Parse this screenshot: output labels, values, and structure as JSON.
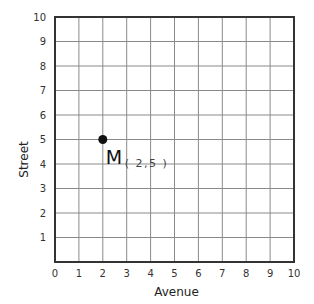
{
  "chart_data": {
    "type": "scatter",
    "title": "",
    "xlabel": "Avenue",
    "ylabel": "Street",
    "xlim": [
      0,
      10
    ],
    "ylim": [
      0,
      10
    ],
    "grid": true,
    "x_ticks": [
      "0",
      "1",
      "2",
      "3",
      "4",
      "5",
      "6",
      "7",
      "8",
      "9",
      "10"
    ],
    "y_ticks": [
      "1",
      "2",
      "3",
      "4",
      "5",
      "6",
      "7",
      "8",
      "9",
      "10"
    ],
    "points": [
      {
        "name": "M",
        "x": 2,
        "y": 5,
        "label": "M",
        "coords_label": "( 2,5 )"
      }
    ],
    "colors": {
      "grid": "#8a8a8a",
      "frame": "#333333",
      "point": "#111111"
    }
  }
}
